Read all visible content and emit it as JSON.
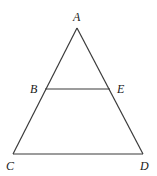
{
  "diagram": {
    "type": "triangle-with-parallel-segment",
    "points": {
      "A": {
        "x": 77,
        "y": 28,
        "label": "A",
        "lx": 73,
        "ly": 21
      },
      "B": {
        "x": 45,
        "y": 89,
        "label": "B",
        "lx": 30,
        "ly": 93
      },
      "E": {
        "x": 110,
        "y": 89,
        "label": "E",
        "lx": 117,
        "ly": 93
      },
      "C": {
        "x": 13,
        "y": 154,
        "label": "C",
        "lx": 6,
        "ly": 170
      },
      "D": {
        "x": 143,
        "y": 154,
        "label": "D",
        "lx": 140,
        "ly": 170
      }
    },
    "segments": [
      [
        "A",
        "C"
      ],
      [
        "A",
        "D"
      ],
      [
        "C",
        "D"
      ],
      [
        "B",
        "E"
      ]
    ],
    "labels": {
      "A": "A",
      "B": "B",
      "C": "C",
      "D": "D",
      "E": "E"
    },
    "stroke_color": "#3a3a3a"
  }
}
